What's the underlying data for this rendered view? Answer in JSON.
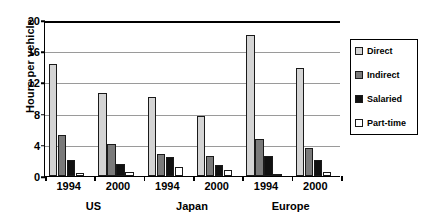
{
  "chart_data": {
    "type": "bar",
    "title": "",
    "xlabel": "",
    "ylabel": "Hours per vehicle",
    "ylim": [
      0,
      20
    ],
    "yticks": [
      0,
      4,
      8,
      12,
      16,
      20
    ],
    "grid": true,
    "legend_position": "right",
    "categories": [
      "1994",
      "2000",
      "1994",
      "2000",
      "1994",
      "2000"
    ],
    "groups": [
      {
        "label": "US",
        "categories": [
          "1994",
          "2000"
        ]
      },
      {
        "label": "Japan",
        "categories": [
          "1994",
          "2000"
        ]
      },
      {
        "label": "Europe",
        "categories": [
          "1994",
          "2000"
        ]
      }
    ],
    "series": [
      {
        "name": "Direct",
        "color": "#d4d4d4",
        "values": [
          14.4,
          10.7,
          10.1,
          7.7,
          18.1,
          13.9
        ]
      },
      {
        "name": "Indirect",
        "color": "#7a7a7a",
        "values": [
          5.2,
          4.1,
          2.8,
          2.6,
          4.7,
          3.6
        ]
      },
      {
        "name": "Salaried",
        "color": "#111111",
        "values": [
          2.0,
          1.6,
          2.4,
          1.4,
          2.6,
          2.1
        ]
      },
      {
        "name": "Part-time",
        "color": "#ffffff",
        "values": [
          0.4,
          0.5,
          1.2,
          0.8,
          0.1,
          0.5
        ]
      }
    ]
  },
  "legend": {
    "items": [
      {
        "label": "Direct"
      },
      {
        "label": "Indirect"
      },
      {
        "label": "Salaried"
      },
      {
        "label": "Part-time"
      }
    ]
  },
  "axis": {
    "y_title": "Hours per vehicle"
  }
}
